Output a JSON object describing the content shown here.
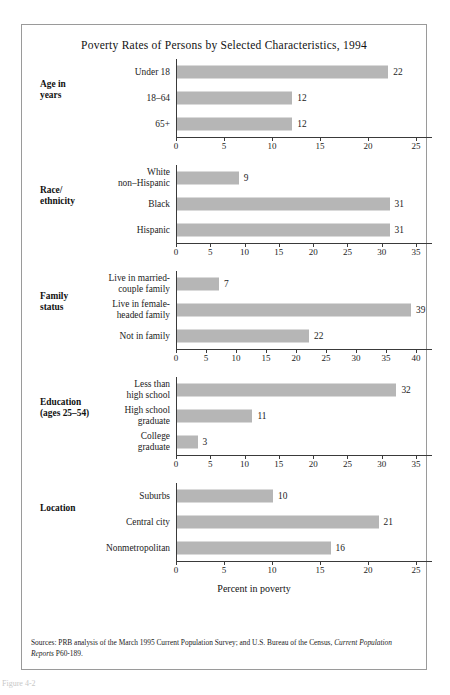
{
  "figure": {
    "title": "Poverty Rates of Persons by Selected Characteristics, 1994",
    "axis_title": "Percent in poverty",
    "caption": "Figure 4-2",
    "sources_prefix": "Sources: PRB analysis of the March 1995 Current Population Survey; and U.S. Bureau of the Census, ",
    "sources_italic": "Current Population Reports",
    "sources_suffix": " P60-189."
  },
  "colors": {
    "bar_fill": "#b6b6b6",
    "frame_border": "#9a9a9a",
    "axis": "#3a3a3a",
    "text": "#1c1c1c"
  },
  "chart_data": {
    "type": "bar",
    "title": "Poverty Rates of Persons by Selected Characteristics, 1994",
    "xlabel": "Percent in poverty",
    "ylabel": "",
    "orientation": "horizontal",
    "grid": false,
    "legend": "none",
    "value_labels": true,
    "groups": [
      {
        "group_label": "Age in\nyears",
        "xlim": [
          0,
          25
        ],
        "xticks": [
          0,
          5,
          10,
          15,
          20,
          25
        ],
        "categories": [
          "Under 18",
          "18–64",
          "65+"
        ],
        "values": [
          22,
          12,
          12
        ]
      },
      {
        "group_label": "Race/\nethnicity",
        "xlim": [
          0,
          35
        ],
        "xticks": [
          0,
          5,
          10,
          15,
          20,
          25,
          30,
          35
        ],
        "categories": [
          "White\nnon–Hispanic",
          "Black",
          "Hispanic"
        ],
        "values": [
          9,
          31,
          31
        ]
      },
      {
        "group_label": "Family\nstatus",
        "xlim": [
          0,
          40
        ],
        "xticks": [
          0,
          5,
          10,
          15,
          20,
          25,
          30,
          35,
          40
        ],
        "categories": [
          "Live in married-\ncouple family",
          "Live in female-\nheaded family",
          "Not in family"
        ],
        "values": [
          7,
          39,
          22
        ]
      },
      {
        "group_label": "Education\n(ages 25–54)",
        "xlim": [
          0,
          35
        ],
        "xticks": [
          0,
          5,
          10,
          15,
          20,
          25,
          30,
          35
        ],
        "categories": [
          "Less than\nhigh school",
          "High school\ngraduate",
          "College\ngraduate"
        ],
        "values": [
          32,
          11,
          3
        ]
      },
      {
        "group_label": "Location",
        "xlim": [
          0,
          25
        ],
        "xticks": [
          0,
          5,
          10,
          15,
          20,
          25
        ],
        "categories": [
          "Suburbs",
          "Central city",
          "Nonmetropolitan"
        ],
        "values": [
          10,
          21,
          16
        ]
      }
    ]
  }
}
